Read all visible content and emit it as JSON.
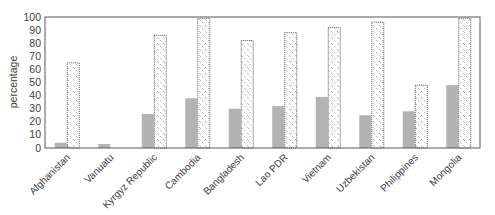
{
  "chart_data": {
    "type": "bar",
    "title": "",
    "xlabel": "",
    "ylabel": "percentage",
    "ylim": [
      0,
      100
    ],
    "yticks": [
      0,
      10,
      20,
      30,
      40,
      50,
      60,
      70,
      80,
      90,
      100
    ],
    "grid": false,
    "legend": null,
    "categories": [
      "Afghanistan",
      "Vanuatu",
      "Kyrgyz Republic",
      "Cambodia",
      "Bangladesh",
      "Lao PDR",
      "Vietnam",
      "Uzbekistan",
      "Philippines",
      "Mongolia"
    ],
    "series": [
      {
        "name": "series 1 (solid gray)",
        "color": "#b3b3b3",
        "values": [
          4,
          3,
          26,
          38,
          30,
          32,
          39,
          25,
          28,
          48
        ]
      },
      {
        "name": "series 2 (hatched, dotted outline)",
        "color": "#ffffff",
        "values": [
          65,
          0,
          86,
          99,
          82,
          88,
          92,
          96,
          48,
          99
        ]
      }
    ]
  }
}
